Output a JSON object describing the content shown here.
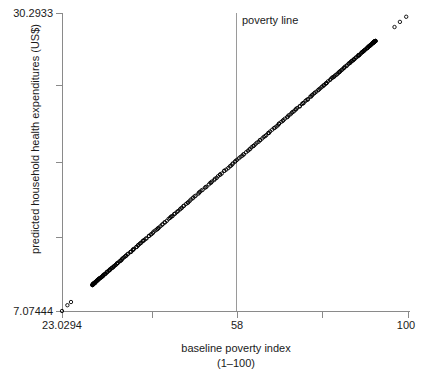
{
  "chart_data": {
    "type": "scatter",
    "title": "",
    "xlabel": "baseline poverty index",
    "xlabel_sub": "(1–100)",
    "ylabel": "predicted household health expenditures (US$)",
    "xlim": [
      23.0294,
      100
    ],
    "ylim": [
      7.07444,
      30.2933
    ],
    "grid": false,
    "legend": null,
    "x_tick_labels": [
      "23.0294",
      "58",
      "100"
    ],
    "x_tick_values": [
      23.0294,
      58,
      100
    ],
    "x_tick_positions_px": [
      62,
      237,
      408
    ],
    "x_tick_all_positions_px": [
      62,
      152,
      237,
      322,
      408
    ],
    "y_tick_labels": [
      "30.2933",
      "7.07444"
    ],
    "y_tick_values": [
      30.2933,
      7.07444
    ],
    "y_tick_all_positions_px": [
      13,
      85,
      162,
      237,
      311
    ],
    "annotations": [
      {
        "name": "poverty-line",
        "label": "poverty line",
        "type": "vline",
        "x_value": 58,
        "x_px": 236,
        "color": "#9a9a9a"
      }
    ],
    "marker": {
      "shape": "open-circle",
      "color": "#000000",
      "size_px": 3.4
    },
    "series": [
      {
        "name": "predicted household health expenditures",
        "relationship": "linear",
        "slope": 0.3019,
        "intercept": 0.1234,
        "n_points": 320,
        "x_min": 23.0294,
        "x_max": 99.6,
        "y_min": 7.07444,
        "y_max": 30.0,
        "note": "Dense overlapping open circles forming a solid line from lower-left to upper-right; sparse isolated circles at both extremes."
      }
    ]
  },
  "axis": {
    "y_top_label": "30.2933",
    "y_bottom_label": "7.07444",
    "x_left_label": "23.0294",
    "x_mid_label": "58",
    "x_right_label": "100",
    "x_title": "baseline poverty index",
    "x_title_sub": "(1–100)",
    "y_title": "predicted household health expenditures (US$)"
  },
  "annotation": {
    "poverty_line_label": "poverty line"
  },
  "colors": {
    "axis": "#8a8a8a",
    "text": "#1a1a1a",
    "marker": "#000000",
    "reference_line": "#9a9a9a",
    "background": "#ffffff"
  }
}
